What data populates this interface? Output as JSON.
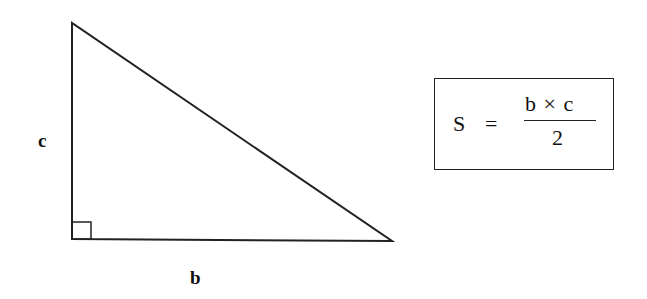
{
  "diagram": {
    "type": "right-triangle-area",
    "triangle": {
      "vertices": {
        "top": [
          72,
          23
        ],
        "right_angle": [
          72,
          239
        ],
        "right": [
          392,
          241
        ]
      },
      "right_angle_marker": true,
      "stroke_color": "#222222"
    },
    "labels": {
      "vertical_side": "c",
      "horizontal_side": "b"
    },
    "formula": {
      "lhs": "S",
      "equals": "=",
      "numerator": "b × c",
      "denominator": "2"
    }
  }
}
